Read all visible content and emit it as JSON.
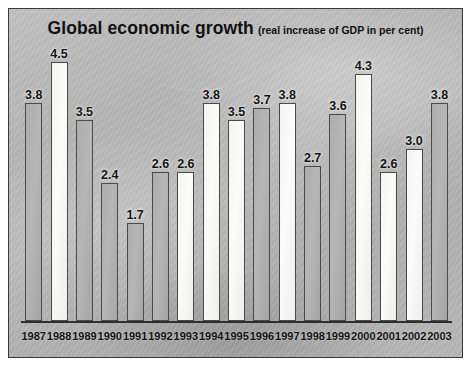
{
  "chart_data": {
    "type": "bar",
    "title": "Global economic growth",
    "subtitle": "(real increase of GDP in per cent)",
    "xlabel": "",
    "ylabel": "",
    "ylim": [
      0,
      4.8
    ],
    "grid": false,
    "legend": null,
    "categories": [
      "1987",
      "1988",
      "1989",
      "1990",
      "1991",
      "1992",
      "1993",
      "1994",
      "1995",
      "1996",
      "1997",
      "1998",
      "1999",
      "2000",
      "2001",
      "2002",
      "2003"
    ],
    "values": [
      3.8,
      4.5,
      3.5,
      2.4,
      1.7,
      2.6,
      2.6,
      3.8,
      3.5,
      3.7,
      3.8,
      2.7,
      3.6,
      4.3,
      2.6,
      3.0,
      3.8
    ],
    "bars": [
      {
        "year": "1987",
        "value": 3.8,
        "label": "3.8",
        "fill": "dark"
      },
      {
        "year": "1988",
        "value": 4.5,
        "label": "4.5",
        "fill": "light"
      },
      {
        "year": "1989",
        "value": 3.5,
        "label": "3.5",
        "fill": "dark"
      },
      {
        "year": "1990",
        "value": 2.4,
        "label": "2.4",
        "fill": "dark"
      },
      {
        "year": "1991",
        "value": 1.7,
        "label": "1.7",
        "fill": "dark"
      },
      {
        "year": "1992",
        "value": 2.6,
        "label": "2.6",
        "fill": "dark"
      },
      {
        "year": "1993",
        "value": 2.6,
        "label": "2.6",
        "fill": "light"
      },
      {
        "year": "1994",
        "value": 3.8,
        "label": "3.8",
        "fill": "light"
      },
      {
        "year": "1995",
        "value": 3.5,
        "label": "3.5",
        "fill": "light"
      },
      {
        "year": "1996",
        "value": 3.7,
        "label": "3.7",
        "fill": "dark"
      },
      {
        "year": "1997",
        "value": 3.8,
        "label": "3.8",
        "fill": "light"
      },
      {
        "year": "1998",
        "value": 2.7,
        "label": "2.7",
        "fill": "dark"
      },
      {
        "year": "1999",
        "value": 3.6,
        "label": "3.6",
        "fill": "dark"
      },
      {
        "year": "2000",
        "value": 4.3,
        "label": "4.3",
        "fill": "light"
      },
      {
        "year": "2001",
        "value": 2.6,
        "label": "2.6",
        "fill": "light"
      },
      {
        "year": "2002",
        "value": 3.0,
        "label": "3.0",
        "fill": "light"
      },
      {
        "year": "2003",
        "value": 3.8,
        "label": "3.8",
        "fill": "dark"
      }
    ]
  },
  "colors": {
    "panel_background": "#b9b9b9",
    "panel_border": "#3a3a3a",
    "axis_line": "#2e2e2e",
    "bar_light": "#f7f7f5",
    "bar_dark": "#b0b0b0",
    "bar_outline": "#4a4a4a",
    "text": "#111111"
  }
}
